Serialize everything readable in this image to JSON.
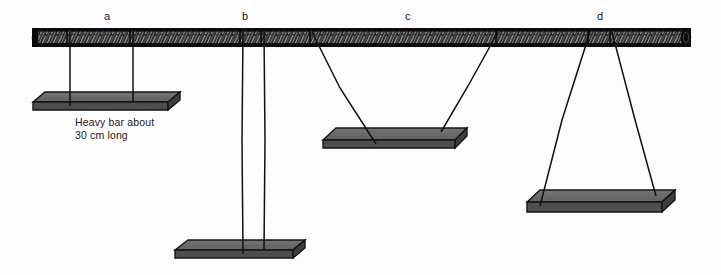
{
  "figure": {
    "width": 721,
    "height": 275,
    "background_color": "#fdfdfd"
  },
  "colors": {
    "beam_fill": "#2b2b2b",
    "beam_grain": "#9a9a9a",
    "beam_outline": "#101010",
    "beam_endcap": "#0d0d0d",
    "bar_top_fill": "#6e6e6e",
    "bar_face_fill": "#5a5a5a",
    "bar_edge_fill": "#4a4a4a",
    "bar_outline": "#141414",
    "string_color": "#101010",
    "text_color": "#151515"
  },
  "beam": {
    "name": "horizontal support beam",
    "x_start": 33,
    "x_end": 690,
    "y_top": 29,
    "y_bottom": 46,
    "material": "wood",
    "grain_style": "diagonal hatching"
  },
  "caption": {
    "line1": "Heavy bar about",
    "line2": "30 cm long",
    "text": "Heavy bar about\n30 cm long",
    "x": 75,
    "y": 116
  },
  "groups": [
    {
      "id": "a",
      "label": "a",
      "label_x": 107,
      "label_y": 12,
      "string_config": "parallel vertical",
      "description": "Two parallel vertical strings of equal short length supporting a bar close to the beam.",
      "beam_attach_x": [
        70,
        133
      ],
      "bar_attach_x": [
        70,
        133
      ],
      "bar": {
        "left": 33,
        "right": 180,
        "y_top": 92,
        "y_bottom": 110,
        "length_cm": 30
      }
    },
    {
      "id": "b",
      "label": "b",
      "label_x": 245,
      "label_y": 12,
      "string_config": "parallel vertical long",
      "description": "Two closely spaced parallel vertical strings, very long, supporting a bar far below the beam.",
      "beam_attach_x": [
        243,
        264
      ],
      "bar_attach_x": [
        243,
        264
      ],
      "bar": {
        "left": 175,
        "right": 305,
        "y_top": 240,
        "y_bottom": 258,
        "length_cm": 30
      }
    },
    {
      "id": "c",
      "label": "c",
      "label_x": 408,
      "label_y": 12,
      "string_config": "converging (V shape)",
      "description": "Two strings attached far apart on the beam converging inward to a bar below.",
      "beam_attach_x": [
        312,
        498
      ],
      "bar_attach_x": [
        375,
        440
      ],
      "bar": {
        "left": 323,
        "right": 467,
        "y_top": 128,
        "y_bottom": 148,
        "length_cm": 30
      }
    },
    {
      "id": "d",
      "label": "d",
      "label_x": 600,
      "label_y": 12,
      "string_config": "diverging (A shape)",
      "description": "Two strings attached close together on the beam diverging outward to a wider bar below.",
      "beam_attach_x": [
        590,
        612
      ],
      "bar_attach_x": [
        540,
        655
      ],
      "bar": {
        "left": 527,
        "right": 675,
        "y_top": 190,
        "y_bottom": 212,
        "length_cm": 30
      }
    }
  ]
}
